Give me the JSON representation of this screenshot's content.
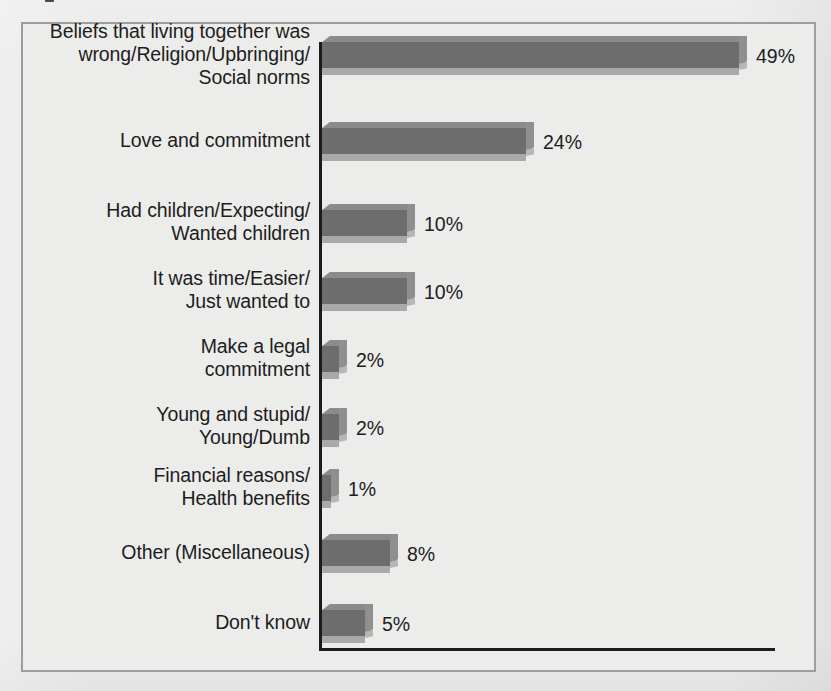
{
  "figure": {
    "background_color": "#ebeaea",
    "frame_border_color": "#9d9d9d",
    "axis_color": "#1c1c1c",
    "bar_face_color": "#6d6d6d",
    "bar_bevel_color": "#a9a9a9",
    "bar_side_color": "#8f8f8f",
    "text_color": "#1d1d1d"
  },
  "chart_data": {
    "type": "bar",
    "orientation": "horizontal",
    "title": "",
    "xlabel": "",
    "ylabel": "",
    "xlim": [
      0,
      49
    ],
    "grid": false,
    "legend": false,
    "value_suffix": "%",
    "categories": [
      "Beliefs that living together was wrong/Religion/Upbringing/Social norms",
      "Love and commitment",
      "Had children/Expecting/Wanted children",
      "It was time/Easier/Just wanted to",
      "Make a legal commitment",
      "Young and stupid/Young/Dumb",
      "Financial reasons/Health benefits",
      "Other (Miscellaneous)",
      "Don't know"
    ],
    "values": [
      49,
      24,
      10,
      10,
      2,
      2,
      1,
      8,
      5
    ],
    "value_labels": [
      "49%",
      "24%",
      "10%",
      "10%",
      "2%",
      "2%",
      "1%",
      "8%",
      "5%"
    ],
    "category_lines": [
      [
        "Beliefs that living together was",
        "wrong/Religion/Upbringing/",
        "Social norms"
      ],
      [
        "Love and commitment"
      ],
      [
        "Had children/Expecting/",
        "Wanted children"
      ],
      [
        "It was time/Easier/",
        "Just wanted to"
      ],
      [
        "Make a legal",
        "commitment"
      ],
      [
        "Young and stupid/",
        "Young/Dumb"
      ],
      [
        "Financial reasons/",
        "Health benefits"
      ],
      [
        "Other (Miscellaneous)"
      ],
      [
        "Don't know"
      ]
    ]
  }
}
